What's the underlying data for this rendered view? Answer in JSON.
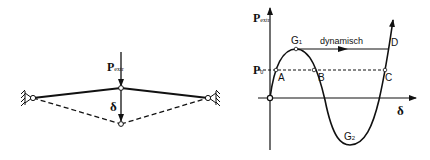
{
  "left_figure": {
    "load_label": "P",
    "load_subscript": "extr",
    "deflection_label": "δ"
  },
  "right_figure": {
    "y_axis_label": "P",
    "y_axis_subscript": "extr",
    "x_axis_label": "δ",
    "p0_label": "P",
    "p0_subscript": "0",
    "points": {
      "A": "A",
      "B": "B",
      "C": "C",
      "D": "D",
      "G1": "G",
      "G1_sub": "1",
      "G2": "G",
      "G2_sub": "2"
    },
    "dynamic_label": "dynamisch"
  },
  "colors": {
    "line": "#111111",
    "background": "#ffffff"
  }
}
